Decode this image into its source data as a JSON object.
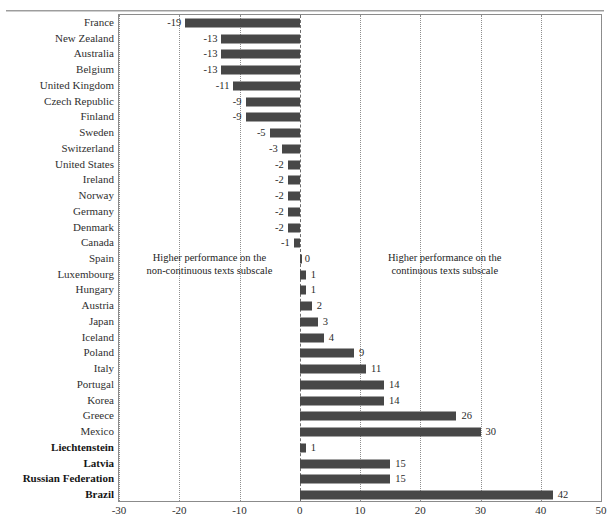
{
  "figure": {
    "title_cut_off": true,
    "bar_color": "#474747",
    "grid_color": "#8e8e8e",
    "frame_color": "#8b8b8b"
  },
  "annotations": {
    "left_line1": "Higher performance on the",
    "left_line2": "non-continuous texts subscale",
    "right_line1": "Higher performance on the",
    "right_line2": "continuous texts subscale"
  },
  "chart_data": {
    "type": "bar",
    "orientation": "horizontal",
    "title": "",
    "xlabel": "",
    "ylabel": "",
    "xlim": [
      -30,
      50
    ],
    "xticks": [
      -30,
      -20,
      -10,
      0,
      10,
      20,
      30,
      40,
      50
    ],
    "xticklabels": [
      "-30",
      "-20",
      "-10",
      "0",
      "10",
      "20",
      "30",
      "40",
      "50"
    ],
    "grid": true,
    "grid_axis": "x",
    "legend": false,
    "zero_line": 0,
    "bar_color": "#474747",
    "categories": [
      "France",
      "New Zealand",
      "Australia",
      "Belgium",
      "United Kingdom",
      "Czech Republic",
      "Finland",
      "Sweden",
      "Switzerland",
      "United States",
      "Ireland",
      "Norway",
      "Germany",
      "Denmark",
      "Canada",
      "Spain",
      "Luxembourg",
      "Hungary",
      "Austria",
      "Japan",
      "Iceland",
      "Poland",
      "Italy",
      "Portugal",
      "Korea",
      "Greece",
      "Mexico",
      "Liechtenstein",
      "Latvia",
      "Russian Federation",
      "Brazil"
    ],
    "values": [
      -19,
      -13,
      -13,
      -13,
      -11,
      -9,
      -9,
      -5,
      -3,
      -2,
      -2,
      -2,
      -2,
      -2,
      -1,
      0,
      1,
      1,
      2,
      3,
      4,
      9,
      11,
      14,
      14,
      26,
      30,
      1,
      15,
      15,
      42
    ],
    "value_labels": [
      "-19",
      "-13",
      "-13",
      "-13",
      "-11",
      "-9",
      "-9",
      "-5",
      "-3",
      "-2",
      "-2",
      "-2",
      "-2",
      "-2",
      "-1",
      "0",
      "1",
      "1",
      "2",
      "3",
      "4",
      "9",
      "11",
      "14",
      "14",
      "26",
      "30",
      "1",
      "15",
      "15",
      "42"
    ],
    "partner_economies": [
      "Liechtenstein",
      "Latvia",
      "Russian Federation",
      "Brazil"
    ]
  }
}
